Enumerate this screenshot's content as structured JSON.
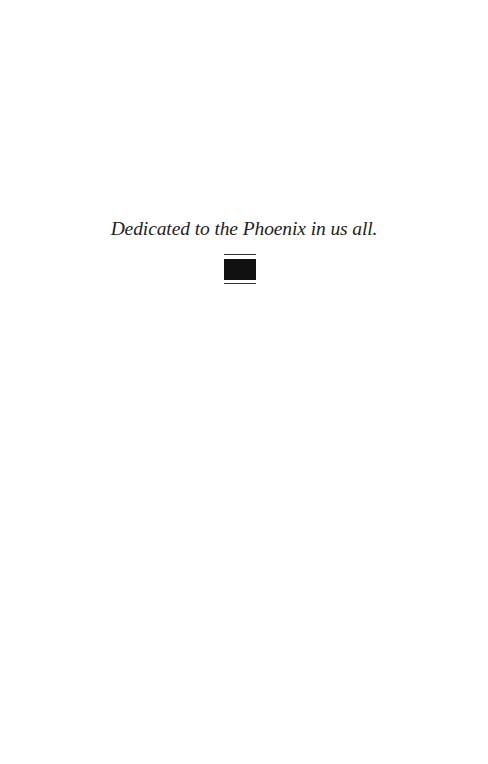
{
  "page": {
    "dedication_text": "Dedicated to the Phoenix in us all.",
    "ornament": {
      "icon": "section-break-ornament-icon",
      "color": "#111111"
    },
    "background_color": "#ffffff"
  }
}
